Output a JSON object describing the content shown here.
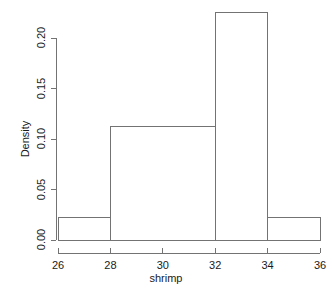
{
  "chart_data": {
    "type": "bar",
    "subtype": "histogram",
    "title": "",
    "xlabel": "shrimp",
    "ylabel": "Density",
    "xlim": [
      26,
      36
    ],
    "ylim": [
      0.0,
      0.225
    ],
    "grid": false,
    "legend": null,
    "bin_edges": [
      26,
      28,
      32,
      34,
      36
    ],
    "bins": [
      {
        "label": "26-28",
        "x0": 26,
        "x1": 28,
        "density": 0.0225
      },
      {
        "label": "28-32",
        "x0": 28,
        "x1": 32,
        "density": 0.1125
      },
      {
        "label": "32-34",
        "x0": 32,
        "x1": 34,
        "density": 0.225
      },
      {
        "label": "34-36",
        "x0": 34,
        "x1": 36,
        "density": 0.0225
      }
    ],
    "categories": [
      "26-28",
      "28-32",
      "32-34",
      "34-36"
    ],
    "values": [
      0.0225,
      0.1125,
      0.225,
      0.0225
    ],
    "x_ticks": [
      26,
      28,
      30,
      32,
      34,
      36
    ],
    "x_tick_labels": [
      "26",
      "28",
      "30",
      "32",
      "34",
      "36"
    ],
    "y_ticks": [
      0.0,
      0.05,
      0.1,
      0.15,
      0.2
    ],
    "y_tick_labels": [
      "0.00",
      "0.05",
      "0.10",
      "0.15",
      "0.20"
    ],
    "colors": {
      "bar_fill": "#ffffff",
      "bar_stroke": "#737373",
      "axis": "#737373",
      "text": "#1a1a1a",
      "background": "#ffffff"
    }
  },
  "axes": {
    "y_title": "Density",
    "x_title": "shrimp"
  }
}
